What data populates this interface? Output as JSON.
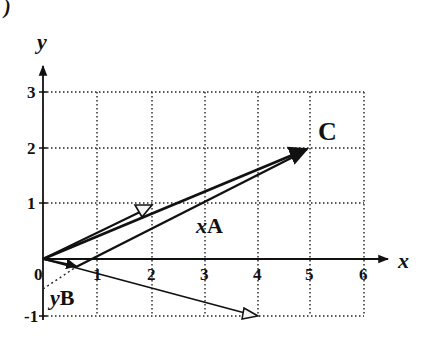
{
  "figure": {
    "corner_mark": ")",
    "axes": {
      "x_label": "x",
      "y_label": "y",
      "x_ticks": [
        "0",
        "1",
        "2",
        "3",
        "4",
        "5",
        "6"
      ],
      "y_ticks": [
        "-1",
        "1",
        "2",
        "3"
      ],
      "x_range": [
        0,
        6
      ],
      "y_range": [
        -1,
        3
      ],
      "grid": "dotted"
    },
    "vectors": [
      {
        "name": "A",
        "from": [
          0,
          0
        ],
        "to": [
          1.9,
          0.9
        ],
        "head": "hollow"
      },
      {
        "name": "B",
        "from": [
          0,
          0
        ],
        "to": [
          4,
          -1
        ],
        "head": "hollow"
      },
      {
        "name": "xA",
        "from": [
          0,
          0
        ],
        "to": [
          5,
          2
        ],
        "head": "solid",
        "label": "xA"
      },
      {
        "name": "yB",
        "from": [
          0,
          0
        ],
        "to": [
          0.6,
          -0.15
        ],
        "head": "solid",
        "label": "yB"
      },
      {
        "name": "xA-shifted",
        "from": [
          0.6,
          -0.15
        ],
        "to": [
          5,
          2
        ],
        "head": "none"
      }
    ],
    "points": [
      {
        "name": "C",
        "at": [
          5,
          2
        ],
        "label": "C"
      }
    ],
    "colors": {
      "ink": "#111111",
      "grid": "#222222",
      "background": "#ffffff"
    }
  }
}
